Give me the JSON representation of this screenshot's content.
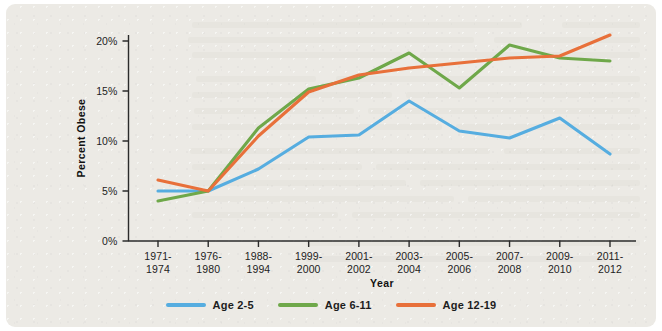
{
  "figure": {
    "panel_background": "#eceae5",
    "page_background": "#ffffff"
  },
  "legend": {
    "position": "bottom-center",
    "items": [
      {
        "label": "Age 2-5",
        "color": "#56ade0",
        "icon": "line-swatch-icon"
      },
      {
        "label": "Age 6-11",
        "color": "#6fa84a",
        "icon": "line-swatch-icon"
      },
      {
        "label": "Age 12-19",
        "color": "#e8703a",
        "icon": "line-swatch-icon"
      }
    ]
  },
  "axes": {
    "x_title": "Year",
    "y_title": "Percent Obese",
    "y_ticks": [
      "0%",
      "5%",
      "10%",
      "15%",
      "20%"
    ],
    "x_ticks": [
      "1971-\n1974",
      "1976-\n1980",
      "1988-\n1994",
      "1999-\n2000",
      "2001-\n2002",
      "2003-\n2004",
      "2005-\n2006",
      "2007-\n2008",
      "2009-\n2010",
      "2011-\n2012"
    ]
  },
  "chart_data": {
    "type": "line",
    "title": "",
    "xlabel": "Year",
    "ylabel": "Percent Obese",
    "ylim": [
      0,
      20
    ],
    "ytick_values": [
      0,
      5,
      10,
      15,
      20
    ],
    "ytick_labels": [
      "0%",
      "5%",
      "10%",
      "15%",
      "20%"
    ],
    "grid": false,
    "legend_position": "bottom-center",
    "categories": [
      "1971-1974",
      "1976-1980",
      "1988-1994",
      "1999-2000",
      "2001-2002",
      "2003-2004",
      "2005-2006",
      "2007-2008",
      "2009-2010",
      "2011-2012"
    ],
    "series": [
      {
        "name": "Age 2-5",
        "color": "#56ade0",
        "values": [
          5.0,
          5.0,
          7.2,
          10.4,
          10.6,
          14.0,
          11.0,
          10.3,
          12.3,
          8.7
        ]
      },
      {
        "name": "Age 6-11",
        "color": "#6fa84a",
        "values": [
          4.0,
          5.0,
          11.3,
          15.2,
          16.3,
          18.8,
          15.3,
          19.6,
          18.3,
          18.0
        ]
      },
      {
        "name": "Age 12-19",
        "color": "#e8703a",
        "values": [
          6.1,
          5.0,
          10.5,
          14.9,
          16.6,
          17.3,
          17.8,
          18.3,
          18.5,
          20.6
        ]
      }
    ]
  }
}
